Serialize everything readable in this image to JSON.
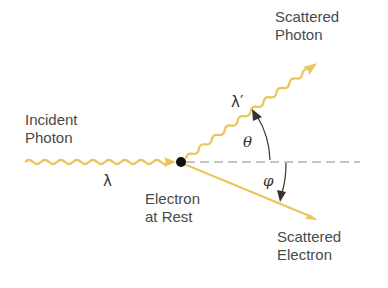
{
  "diagram": {
    "labels": {
      "incident_photon": [
        "Incident",
        "Photon"
      ],
      "scattered_photon": [
        "Scattered",
        "Photon"
      ],
      "scattered_electron": [
        "Scattered",
        "Electron"
      ],
      "electron_at_rest": [
        "Electron",
        "at Rest"
      ],
      "lambda": "λ",
      "lambda_prime": "λ′",
      "theta": "θ",
      "phi": "φ"
    },
    "colors": {
      "photon_wave": "#e8c65a",
      "electron_path": "#e8c65a",
      "electron": "#111111",
      "dashed_axis": "#888888",
      "angle_arrow": "#333333",
      "text": "#4a4a4a"
    }
  }
}
